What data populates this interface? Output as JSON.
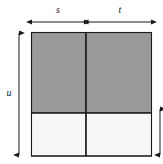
{
  "figure": {
    "kind": "geometry-diagram",
    "colors": {
      "shaded_fill": "#999999",
      "unshaded_fill": "#f7f7f5",
      "stroke": "#1a1a1a",
      "background": "#ffffff"
    },
    "labels": {
      "width_left": "s",
      "width_right": "t",
      "height_total": "u",
      "height_right": ""
    },
    "rect": {
      "left": 31,
      "top": 32,
      "right": 152,
      "bottom": 156,
      "vertical_divider_x": 86,
      "horizontal_divider_y": 113
    },
    "dimensions": {
      "s_arrow": {
        "x1": 32,
        "x2": 84,
        "y": 22
      },
      "t_arrow": {
        "x1": 88,
        "x2": 151,
        "y": 22
      },
      "u_arrow": {
        "x": 19,
        "y1": 33,
        "y2": 155
      },
      "right_arrow": {
        "x": 160,
        "y1": 108,
        "y2": 156
      }
    },
    "quadrants": [
      {
        "name": "top-left",
        "fill": "shaded",
        "width_label": "s",
        "height_label": ""
      },
      {
        "name": "top-right",
        "fill": "shaded",
        "width_label": "t",
        "height_label": ""
      },
      {
        "name": "bottom-left",
        "fill": "unshaded",
        "width_label": "s",
        "height_label": ""
      },
      {
        "name": "bottom-right",
        "fill": "unshaded",
        "width_label": "t",
        "height_label": ""
      }
    ]
  }
}
